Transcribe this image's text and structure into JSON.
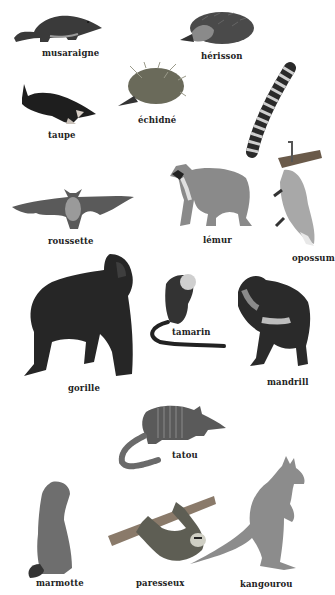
{
  "plate": {
    "background": "#ffffff",
    "animals": [
      {
        "id": "musaraigne",
        "label": "musaraigne"
      },
      {
        "id": "herisson",
        "label": "hérisson"
      },
      {
        "id": "taupe",
        "label": "taupe"
      },
      {
        "id": "echidne",
        "label": "échidné"
      },
      {
        "id": "roussette",
        "label": "roussette"
      },
      {
        "id": "lemur",
        "label": "lémur"
      },
      {
        "id": "opossum",
        "label": "opossum"
      },
      {
        "id": "gorille",
        "label": "gorille"
      },
      {
        "id": "tamarin",
        "label": "tamarin"
      },
      {
        "id": "mandrill",
        "label": "mandrill"
      },
      {
        "id": "tatou",
        "label": "tatou"
      },
      {
        "id": "marmotte",
        "label": "marmotte"
      },
      {
        "id": "paresseux",
        "label": "paresseux"
      },
      {
        "id": "kangourou",
        "label": "kangourou"
      }
    ]
  }
}
